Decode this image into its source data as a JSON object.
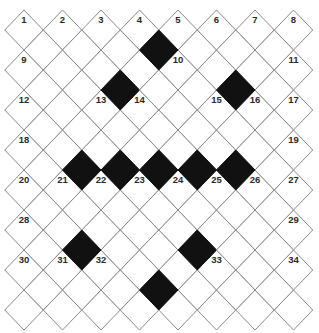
{
  "puzzle": {
    "type": "diamond-crossword",
    "colors": {
      "line": "#8a8a8a",
      "block": "#111111",
      "cell": "#ffffff",
      "number": "#2a2a2a"
    },
    "geometry": {
      "half_width": 19.25,
      "half_height": 20,
      "rowA_origin": [
        24,
        30
      ],
      "rowB_origin": [
        43.25,
        50
      ],
      "pitch_x": 38.5,
      "pitch_y": 40,
      "rowA_rows": 8,
      "rowA_cols": 8,
      "rowB_rows": 7,
      "rowB_cols": 7
    },
    "numbered_cells": [
      {
        "set": "A",
        "r": 0,
        "c": 0,
        "n": "1"
      },
      {
        "set": "A",
        "r": 0,
        "c": 1,
        "n": "2"
      },
      {
        "set": "A",
        "r": 0,
        "c": 2,
        "n": "3"
      },
      {
        "set": "A",
        "r": 0,
        "c": 3,
        "n": "4"
      },
      {
        "set": "A",
        "r": 0,
        "c": 4,
        "n": "5"
      },
      {
        "set": "A",
        "r": 0,
        "c": 5,
        "n": "6"
      },
      {
        "set": "A",
        "r": 0,
        "c": 6,
        "n": "7"
      },
      {
        "set": "A",
        "r": 0,
        "c": 7,
        "n": "8"
      },
      {
        "set": "A",
        "r": 1,
        "c": 0,
        "n": "9"
      },
      {
        "set": "A",
        "r": 1,
        "c": 4,
        "n": "10"
      },
      {
        "set": "A",
        "r": 1,
        "c": 7,
        "n": "11"
      },
      {
        "set": "A",
        "r": 2,
        "c": 0,
        "n": "12"
      },
      {
        "set": "A",
        "r": 2,
        "c": 2,
        "n": "13"
      },
      {
        "set": "A",
        "r": 2,
        "c": 3,
        "n": "14"
      },
      {
        "set": "A",
        "r": 2,
        "c": 5,
        "n": "15"
      },
      {
        "set": "A",
        "r": 2,
        "c": 6,
        "n": "16"
      },
      {
        "set": "A",
        "r": 2,
        "c": 7,
        "n": "17"
      },
      {
        "set": "A",
        "r": 3,
        "c": 0,
        "n": "18"
      },
      {
        "set": "A",
        "r": 3,
        "c": 7,
        "n": "19"
      },
      {
        "set": "A",
        "r": 4,
        "c": 0,
        "n": "20"
      },
      {
        "set": "A",
        "r": 4,
        "c": 1,
        "n": "21"
      },
      {
        "set": "A",
        "r": 4,
        "c": 2,
        "n": "22"
      },
      {
        "set": "A",
        "r": 4,
        "c": 3,
        "n": "23"
      },
      {
        "set": "A",
        "r": 4,
        "c": 4,
        "n": "24"
      },
      {
        "set": "A",
        "r": 4,
        "c": 5,
        "n": "25"
      },
      {
        "set": "A",
        "r": 4,
        "c": 6,
        "n": "26"
      },
      {
        "set": "A",
        "r": 4,
        "c": 7,
        "n": "27"
      },
      {
        "set": "A",
        "r": 5,
        "c": 0,
        "n": "28"
      },
      {
        "set": "A",
        "r": 5,
        "c": 7,
        "n": "29"
      },
      {
        "set": "A",
        "r": 6,
        "c": 0,
        "n": "30"
      },
      {
        "set": "A",
        "r": 6,
        "c": 1,
        "n": "31"
      },
      {
        "set": "A",
        "r": 6,
        "c": 2,
        "n": "32"
      },
      {
        "set": "A",
        "r": 6,
        "c": 5,
        "n": "33"
      },
      {
        "set": "A",
        "r": 6,
        "c": 7,
        "n": "34"
      }
    ],
    "blocked_cells": [
      {
        "set": "B",
        "r": 0,
        "c": 3
      },
      {
        "set": "B",
        "r": 1,
        "c": 2
      },
      {
        "set": "B",
        "r": 1,
        "c": 5
      },
      {
        "set": "B",
        "r": 3,
        "c": 1
      },
      {
        "set": "B",
        "r": 3,
        "c": 2
      },
      {
        "set": "B",
        "r": 3,
        "c": 3
      },
      {
        "set": "B",
        "r": 3,
        "c": 4
      },
      {
        "set": "B",
        "r": 3,
        "c": 5
      },
      {
        "set": "B",
        "r": 5,
        "c": 1
      },
      {
        "set": "B",
        "r": 5,
        "c": 4
      },
      {
        "set": "B",
        "r": 6,
        "c": 3
      }
    ]
  }
}
